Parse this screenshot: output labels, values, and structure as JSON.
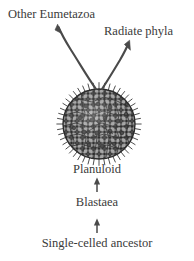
{
  "figure": {
    "kind": "phylogenetic-origin-diagram",
    "background_color": "#ffffff",
    "ink_color": "#3a3a3a",
    "labels": {
      "other_eumetazoa": "Other Eumetazoa",
      "radiate_phyla": "Radiate phyla",
      "planuloid": "Planuloid",
      "blastaea": "Blastaea",
      "single_celled_ancestor": "Single-celled ancestor"
    },
    "organism": {
      "name": "planuloid-organism",
      "shape": "ellipse",
      "cell_fill": "#b0b0b0",
      "cell_outline": "#303030",
      "nucleus_color": "#4a4a4a",
      "has_cilia": true
    },
    "branches": [
      {
        "name": "branch-to-other-eumetazoa",
        "target": "Other Eumetazoa",
        "arrowhead": true
      },
      {
        "name": "branch-to-radiate-phyla",
        "target": "Radiate phyla",
        "arrowhead": true
      }
    ],
    "lineage_arrows": [
      {
        "name": "arrow-blastaea-to-planuloid",
        "from": "Blastaea",
        "to": "Planuloid",
        "direction": "up"
      },
      {
        "name": "arrow-ancestor-to-blastaea",
        "from": "Single-celled ancestor",
        "to": "Blastaea",
        "direction": "up"
      }
    ]
  }
}
